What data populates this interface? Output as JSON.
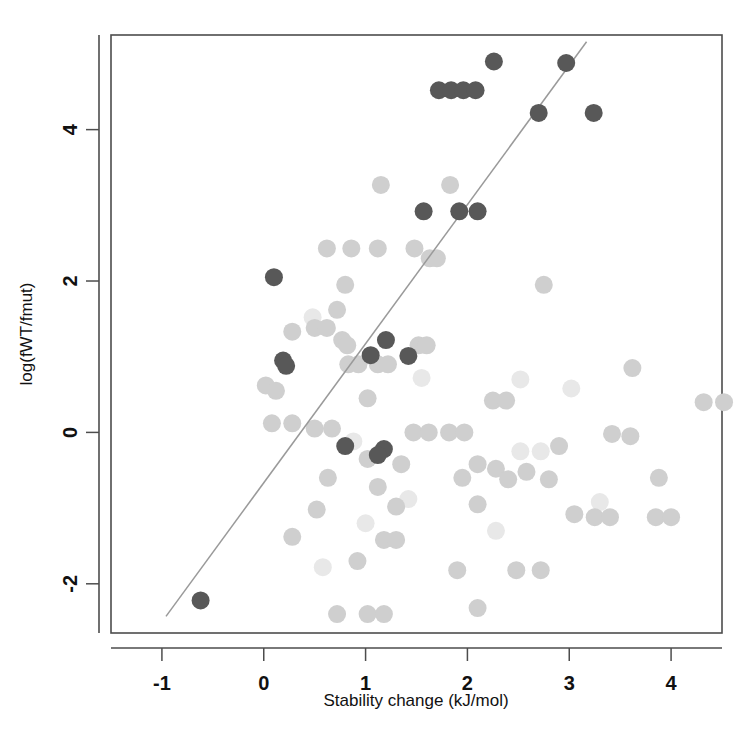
{
  "chart_data": {
    "type": "scatter",
    "title": "",
    "xlabel": "Stability change (kJ/mol)",
    "ylabel": "log(fWT/fmut)",
    "xlim": [
      -1.5,
      4.5
    ],
    "ylim": [
      -2.65,
      5.25
    ],
    "xticks": [
      -1,
      0,
      1,
      2,
      3,
      4
    ],
    "xtick_labels": [
      "-1",
      "0",
      "1",
      "2",
      "3",
      "4"
    ],
    "yticks": [
      -2,
      0,
      2,
      4
    ],
    "ytick_labels": [
      "-2",
      "0",
      "2",
      "4"
    ],
    "grid": false,
    "legend": "none",
    "colors": {
      "highlight_point": "#585858",
      "background_point": "#cfcfcf",
      "faint_point": "#e8e8e8",
      "regression_line": "#9a9a9a",
      "axis": "#4d4d4d"
    },
    "point_radius_px": 9,
    "series": [
      {
        "name": "highlighted",
        "style": "dark-gray filled circle",
        "points": [
          [
            2.26,
            4.9
          ],
          [
            2.97,
            4.88
          ],
          [
            1.72,
            4.52
          ],
          [
            1.84,
            4.52
          ],
          [
            1.96,
            4.52
          ],
          [
            2.08,
            4.52
          ],
          [
            2.7,
            4.22
          ],
          [
            3.24,
            4.22
          ],
          [
            1.57,
            2.92
          ],
          [
            1.92,
            2.92
          ],
          [
            2.1,
            2.92
          ],
          [
            0.1,
            2.05
          ],
          [
            1.2,
            1.22
          ],
          [
            1.05,
            1.02
          ],
          [
            1.42,
            1.01
          ],
          [
            0.19,
            0.95
          ],
          [
            0.22,
            0.88
          ],
          [
            0.8,
            -0.18
          ],
          [
            1.18,
            -0.22
          ],
          [
            1.12,
            -0.3
          ],
          [
            -0.62,
            -2.22
          ]
        ]
      },
      {
        "name": "background",
        "style": "light-gray filled circle",
        "points": [
          [
            1.15,
            3.27
          ],
          [
            1.83,
            3.27
          ],
          [
            0.62,
            2.43
          ],
          [
            0.86,
            2.43
          ],
          [
            1.12,
            2.43
          ],
          [
            1.48,
            2.43
          ],
          [
            1.63,
            2.3
          ],
          [
            1.7,
            2.3
          ],
          [
            0.8,
            1.95
          ],
          [
            2.75,
            1.95
          ],
          [
            0.72,
            1.62
          ],
          [
            0.5,
            1.38
          ],
          [
            0.62,
            1.38
          ],
          [
            0.28,
            1.33
          ],
          [
            0.77,
            1.22
          ],
          [
            0.82,
            1.15
          ],
          [
            1.52,
            1.15
          ],
          [
            1.6,
            1.15
          ],
          [
            0.83,
            0.9
          ],
          [
            0.93,
            0.9
          ],
          [
            1.12,
            0.9
          ],
          [
            1.22,
            0.9
          ],
          [
            3.62,
            0.85
          ],
          [
            0.02,
            0.62
          ],
          [
            0.12,
            0.55
          ],
          [
            1.02,
            0.45
          ],
          [
            2.25,
            0.42
          ],
          [
            2.38,
            0.42
          ],
          [
            4.32,
            0.4
          ],
          [
            4.52,
            0.4
          ],
          [
            0.08,
            0.12
          ],
          [
            0.28,
            0.12
          ],
          [
            0.5,
            0.05
          ],
          [
            0.67,
            0.05
          ],
          [
            1.47,
            0.0
          ],
          [
            1.62,
            0.0
          ],
          [
            1.82,
            0.0
          ],
          [
            1.97,
            0.0
          ],
          [
            3.42,
            -0.02
          ],
          [
            3.6,
            -0.05
          ],
          [
            2.9,
            -0.18
          ],
          [
            1.02,
            -0.35
          ],
          [
            1.35,
            -0.42
          ],
          [
            2.1,
            -0.42
          ],
          [
            2.28,
            -0.48
          ],
          [
            2.58,
            -0.52
          ],
          [
            0.63,
            -0.6
          ],
          [
            1.95,
            -0.6
          ],
          [
            2.4,
            -0.62
          ],
          [
            2.8,
            -0.62
          ],
          [
            3.88,
            -0.6
          ],
          [
            1.12,
            -0.72
          ],
          [
            0.52,
            -1.02
          ],
          [
            1.3,
            -0.98
          ],
          [
            2.1,
            -0.95
          ],
          [
            3.05,
            -1.08
          ],
          [
            3.25,
            -1.12
          ],
          [
            3.4,
            -1.12
          ],
          [
            3.85,
            -1.12
          ],
          [
            4.0,
            -1.12
          ],
          [
            0.28,
            -1.38
          ],
          [
            1.18,
            -1.42
          ],
          [
            1.3,
            -1.42
          ],
          [
            0.92,
            -1.7
          ],
          [
            1.9,
            -1.82
          ],
          [
            2.48,
            -1.82
          ],
          [
            2.72,
            -1.82
          ],
          [
            2.1,
            -2.32
          ],
          [
            0.72,
            -2.4
          ],
          [
            1.02,
            -2.4
          ],
          [
            1.18,
            -2.4
          ]
        ]
      },
      {
        "name": "faint",
        "style": "very light gray circle",
        "points": [
          [
            0.48,
            1.52
          ],
          [
            1.55,
            0.72
          ],
          [
            2.52,
            0.7
          ],
          [
            3.02,
            0.58
          ],
          [
            0.88,
            -0.12
          ],
          [
            2.52,
            -0.25
          ],
          [
            2.72,
            -0.25
          ],
          [
            1.42,
            -0.88
          ],
          [
            1.0,
            -1.2
          ],
          [
            2.28,
            -1.3
          ],
          [
            0.58,
            -1.78
          ],
          [
            3.3,
            -0.92
          ]
        ]
      }
    ],
    "regression_line": {
      "style": "solid thin gray line",
      "x_start": -0.96,
      "y_start": -2.43,
      "x_end": 3.17,
      "y_end": 5.16,
      "slope": 1.84,
      "intercept": -0.66
    }
  },
  "axes": {
    "x_title": "Stability change (kJ/mol)",
    "y_title": "log(fWT/fmut)"
  }
}
